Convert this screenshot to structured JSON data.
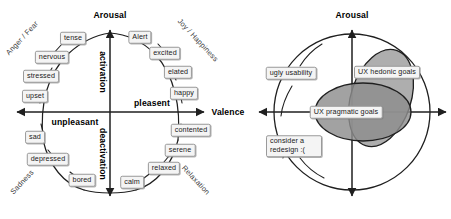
{
  "figure": {
    "title": "",
    "panels": [
      {
        "id": "circumplex",
        "name": "circumplex-model-of-affect",
        "axes": {
          "vertical_label": "Arousal",
          "horizontal_label": "Valence",
          "quadrant_up_inner": "activation",
          "quadrant_down_inner": "deactivation",
          "left_inner": "unpleasant",
          "right_inner": "pleasent"
        },
        "quadrant_names": [
          {
            "label": "Anger / Fear",
            "position": "top-left"
          },
          {
            "label": "Joy / Happiness",
            "position": "top-right"
          },
          {
            "label": "Sadness",
            "position": "bottom-left"
          },
          {
            "label": "Relaxation",
            "position": "bottom-right"
          }
        ],
        "emotions": [
          {
            "label": "tense",
            "angle_deg": 108
          },
          {
            "label": "Alert",
            "angle_deg": 72
          },
          {
            "label": "nervous",
            "angle_deg": 127
          },
          {
            "label": "excited",
            "angle_deg": 54
          },
          {
            "label": "stressed",
            "angle_deg": 146
          },
          {
            "label": "elated",
            "angle_deg": 36
          },
          {
            "label": "upset",
            "angle_deg": 164
          },
          {
            "label": "happy",
            "angle_deg": 18
          },
          {
            "label": "sad",
            "angle_deg": 198
          },
          {
            "label": "contented",
            "angle_deg": 342
          },
          {
            "label": "depressed",
            "angle_deg": 217
          },
          {
            "label": "serene",
            "angle_deg": 324
          },
          {
            "label": "bored",
            "angle_deg": 242
          },
          {
            "label": "relaxed",
            "angle_deg": 306
          },
          {
            "label": "calm",
            "angle_deg": 285
          }
        ]
      },
      {
        "id": "ux-goals",
        "name": "ux-goals-diagram",
        "axes": {
          "vertical_label": "Arousal",
          "horizontal_label": "Valence"
        },
        "regions": [
          {
            "label": "UX hedonic goals",
            "fill": "#9a9a9a",
            "shape": "tilted-ellipse"
          },
          {
            "label": "UX pragmatic goals",
            "fill": "#8e8e8e",
            "shape": "horizontal-ellipse"
          }
        ],
        "callouts": [
          {
            "label": "ugly usability",
            "lines": [
              "ugly usability"
            ]
          },
          {
            "label": "consider a redesign :(",
            "lines": [
              "consider a",
              "redesign :("
            ]
          }
        ]
      }
    ]
  },
  "colors": {
    "stroke": "#1f1f1f",
    "chip_fill": "#f4f4f4",
    "chip_border": "#9a9a9a",
    "hedonic_fill": "#9c9c9c",
    "pragmatic_fill": "#8d8d8d",
    "overlap_fill": "#7b7b7b",
    "background": "#ffffff"
  }
}
